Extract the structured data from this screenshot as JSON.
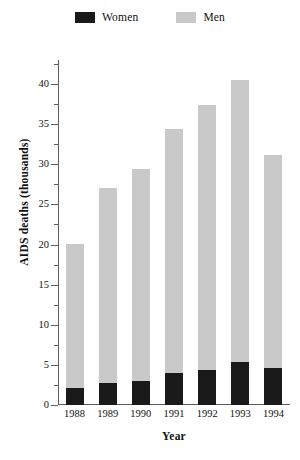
{
  "chart_data": {
    "type": "bar",
    "subtype": "stacked-vertical",
    "title": "",
    "xlabel": "Year",
    "ylabel": "AIDS deaths (thousands)",
    "categories": [
      "1988",
      "1989",
      "1990",
      "1991",
      "1992",
      "1993",
      "1994"
    ],
    "series": [
      {
        "name": "Women",
        "color": "#1a1a1a",
        "values": [
          2.1,
          2.7,
          3.0,
          4.0,
          4.4,
          5.4,
          4.6
        ]
      },
      {
        "name": "Men",
        "color": "#c9c9c9",
        "values": [
          18.0,
          24.3,
          26.4,
          30.4,
          33.0,
          35.1,
          26.6
        ]
      }
    ],
    "totals": [
      20.1,
      27.0,
      29.4,
      34.4,
      37.4,
      40.5,
      31.2
    ],
    "ylim": [
      0,
      43
    ],
    "ytick_major": [
      0,
      5,
      10,
      15,
      20,
      25,
      30,
      35,
      40
    ],
    "ytick_major_labels": [
      "0",
      "5",
      "10",
      "15",
      "20",
      "25",
      "30",
      "35",
      "40"
    ],
    "ytick_minor": [
      2.5,
      7.5,
      12.5,
      17.5,
      22.5,
      27.5,
      32.5,
      37.5,
      42.5
    ],
    "grid": false,
    "legend_position": "top-center"
  },
  "legend": {
    "items": [
      {
        "label": "Women",
        "color": "#1a1a1a",
        "swatch_name": "women-swatch"
      },
      {
        "label": "Men",
        "color": "#c9c9c9",
        "swatch_name": "men-swatch"
      }
    ]
  },
  "axes": {
    "x_title": "Year",
    "y_title": "AIDS deaths (thousands)"
  }
}
